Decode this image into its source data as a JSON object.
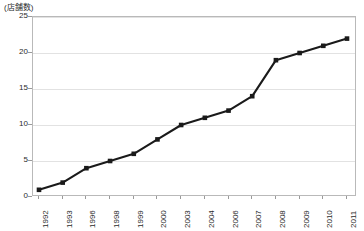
{
  "chart_data": {
    "type": "line",
    "title": "",
    "subtitle": "",
    "xlabel": "",
    "ylabel": "(店舗数)",
    "y_unit_caption": "(店舗数)",
    "categories": [
      "1992",
      "1993",
      "1996",
      "1998",
      "1999",
      "2000",
      "2003",
      "2004",
      "2006",
      "2007",
      "2008",
      "2009",
      "2010",
      "2011"
    ],
    "values": [
      1,
      2,
      4,
      5,
      6,
      8,
      10,
      11,
      12,
      14,
      19,
      20,
      21,
      22
    ],
    "series": [
      {
        "name": "店舗数",
        "values": [
          1,
          2,
          4,
          5,
          6,
          8,
          10,
          11,
          12,
          14,
          19,
          20,
          21,
          22
        ]
      }
    ],
    "ylim": [
      0,
      25
    ],
    "yticks": [
      0,
      5,
      10,
      15,
      20,
      25
    ],
    "ytick_labels": [
      "0",
      "5",
      "10",
      "15",
      "20",
      "25"
    ],
    "grid": true,
    "grid_axis": "y",
    "legend": false,
    "legend_position": "none",
    "marker": "square",
    "line_color": "#1a1a1a",
    "marker_color": "#1a1a1a",
    "grid_color": "#e2e2e2",
    "axis_color": "#b9b9b9",
    "background_color": "#ffffff",
    "x_label_rotation": -90
  }
}
